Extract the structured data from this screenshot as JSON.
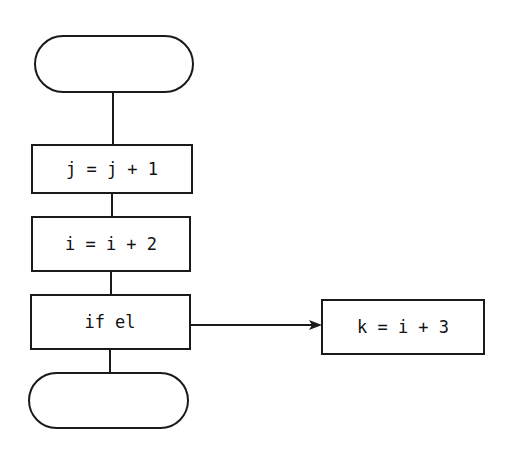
{
  "diagram": {
    "type": "flowchart",
    "nodes": [
      {
        "id": "start",
        "shape": "terminator",
        "label": ""
      },
      {
        "id": "step1",
        "shape": "process",
        "label": "j = j + 1"
      },
      {
        "id": "step2",
        "shape": "process",
        "label": "i = i + 2"
      },
      {
        "id": "cond",
        "shape": "process",
        "label": "if el"
      },
      {
        "id": "branch",
        "shape": "process",
        "label": "k = i + 3"
      },
      {
        "id": "end",
        "shape": "terminator",
        "label": ""
      }
    ],
    "edges": [
      {
        "from": "start",
        "to": "step1"
      },
      {
        "from": "step1",
        "to": "step2"
      },
      {
        "from": "step2",
        "to": "cond"
      },
      {
        "from": "cond",
        "to": "end"
      },
      {
        "from": "cond",
        "to": "branch",
        "arrow": true
      }
    ],
    "colors": {
      "stroke": "#1a1a1a",
      "background": "#ffffff"
    }
  }
}
